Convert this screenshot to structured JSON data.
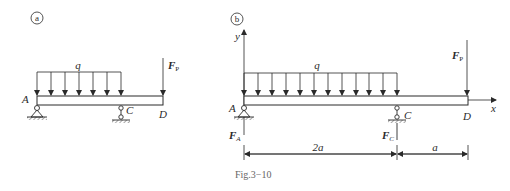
{
  "figure": {
    "caption": "Fig.3−10",
    "panels": [
      {
        "id": "a",
        "circle_label": "a",
        "labels": {
          "A": "A",
          "C": "C",
          "D": "D",
          "q": "q",
          "FP_main": "F",
          "FP_sub": "P"
        }
      },
      {
        "id": "b",
        "circle_label": "b",
        "labels": {
          "A": "A",
          "C": "C",
          "D": "D",
          "q": "q",
          "FP_main": "F",
          "FP_sub": "P",
          "FA_main": "F",
          "FA_sub": "A",
          "FC_main": "F",
          "FC_sub": "C",
          "x_axis": "x",
          "y_axis": "y",
          "dim_AC": "2a",
          "dim_CD": "a"
        }
      }
    ]
  },
  "colors": {
    "line": "#2a2a2a",
    "caption": "#666666",
    "background": "#ffffff"
  }
}
